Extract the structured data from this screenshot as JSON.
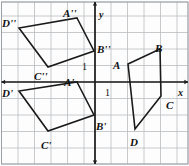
{
  "figure": {
    "grid": {
      "cell_px": 16.5,
      "origin_px": [
        95,
        82
      ],
      "x_lines_px": [
        1.5,
        18,
        34.5,
        51,
        67.5,
        84,
        95,
        111,
        127.5,
        144,
        160.5,
        177,
        188
      ],
      "y_lines_px": [
        2,
        16,
        32.5,
        49,
        65.5,
        82,
        98.5,
        115,
        131.5,
        148,
        164
      ],
      "color": "#b9bcc0",
      "border_color": "#9aa0a6",
      "show_grid": true
    },
    "axes": {
      "axis_color": "#1a1a1a",
      "x_axis": {
        "label": "x",
        "label_pos_px": [
          178,
          88
        ],
        "y_px": 82,
        "arrows": "both"
      },
      "y_axis": {
        "label": "y",
        "label_pos_px": [
          99,
          10
        ],
        "x_px": 95,
        "arrows": "both"
      },
      "unit_ticks": [
        {
          "text": "1",
          "pos_px": [
            82,
            62
          ],
          "axis": "y"
        },
        {
          "text": "1",
          "pos_px": [
            105,
            88
          ],
          "axis": "x"
        }
      ]
    },
    "shapes": [
      {
        "name": "ABCD",
        "stroke": "#1a1a1a",
        "stroke_width": 1.6,
        "points_px": [
          [
            128,
            64
          ],
          [
            160,
            49
          ],
          [
            161,
            96
          ],
          [
            135,
            129
          ]
        ],
        "vertices": [
          {
            "label": "A",
            "point_px": [
              128,
              64
            ],
            "label_pos_px": [
              113,
              60
            ]
          },
          {
            "label": "B",
            "point_px": [
              160,
              49
            ],
            "label_pos_px": [
              155,
              43
            ]
          },
          {
            "label": "C",
            "point_px": [
              161,
              96
            ],
            "label_pos_px": [
              166,
              100
            ]
          },
          {
            "label": "D",
            "point_px": [
              135,
              129
            ],
            "label_pos_px": [
              130,
              137
            ]
          }
        ]
      },
      {
        "name": "A'B'C'D'",
        "stroke": "#1a1a1a",
        "stroke_width": 1.6,
        "points_px": [
          [
            77,
            82
          ],
          [
            94,
            115
          ],
          [
            48,
            131
          ],
          [
            19,
            91
          ]
        ],
        "vertices": [
          {
            "label": "A'",
            "point_px": [
              77,
              82
            ],
            "label_pos_px": [
              64,
              77
            ]
          },
          {
            "label": "B'",
            "point_px": [
              94,
              115
            ],
            "label_pos_px": [
              96,
              121
            ]
          },
          {
            "label": "C'",
            "point_px": [
              48,
              131
            ],
            "label_pos_px": [
              41,
              140
            ]
          },
          {
            "label": "D'",
            "point_px": [
              19,
              91
            ],
            "label_pos_px": [
              2,
              88
            ]
          }
        ]
      },
      {
        "name": "A''B''C''D''",
        "stroke": "#1a1a1a",
        "stroke_width": 1.6,
        "points_px": [
          [
            77,
            18
          ],
          [
            94,
            51
          ],
          [
            48,
            67
          ],
          [
            19,
            28
          ]
        ],
        "vertices": [
          {
            "label": "A''",
            "point_px": [
              77,
              18
            ],
            "label_pos_px": [
              63,
              8
            ]
          },
          {
            "label": "B''",
            "point_px": [
              94,
              51
            ],
            "label_pos_px": [
              97,
              44
            ]
          },
          {
            "label": "C''",
            "point_px": [
              48,
              67
            ],
            "label_pos_px": [
              34,
              71
            ]
          },
          {
            "label": "D''",
            "point_px": [
              19,
              28
            ],
            "label_pos_px": [
              2,
              18
            ]
          }
        ]
      }
    ]
  }
}
